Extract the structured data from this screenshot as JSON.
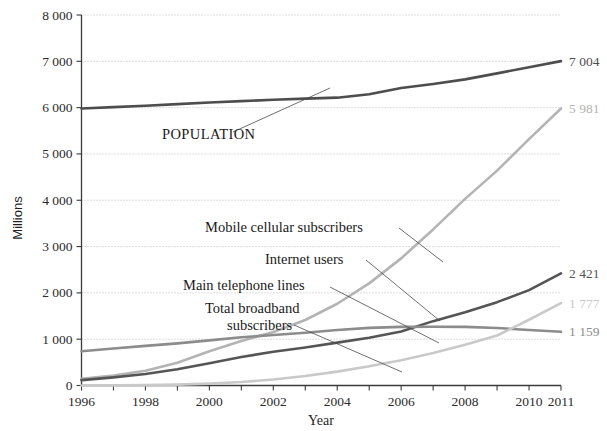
{
  "chart_data": {
    "type": "line",
    "title": "",
    "xlabel": "Year",
    "ylabel": "Millions",
    "xlim": [
      1996,
      2011
    ],
    "ylim": [
      0,
      8000
    ],
    "grid": true,
    "legend_position": "inline-annotations",
    "x": [
      1996,
      1997,
      1998,
      1999,
      2000,
      2001,
      2002,
      2003,
      2004,
      2005,
      2006,
      2007,
      2008,
      2009,
      2010,
      2011
    ],
    "ytick_labels": [
      "0",
      "1 000",
      "2 000",
      "3 000",
      "4 000",
      "5 000",
      "6 000",
      "7 000",
      "8 000"
    ],
    "ytick_values": [
      0,
      1000,
      2000,
      3000,
      4000,
      5000,
      6000,
      7000,
      8000
    ],
    "xtick_labels": [
      "1996",
      "1998",
      "2000",
      "2002",
      "2004",
      "2006",
      "2008",
      "2010",
      "2011"
    ],
    "xtick_values": [
      1996,
      1998,
      2000,
      2002,
      2004,
      2006,
      2008,
      2010,
      2011
    ],
    "series": [
      {
        "name": "POPULATION",
        "color": "#4d4d4d",
        "width": 2.6,
        "label_style": "uppercase",
        "end_value_label": "7 004",
        "end_value": 7004,
        "values": [
          5980,
          6010,
          6040,
          6075,
          6110,
          6140,
          6170,
          6195,
          6215,
          6290,
          6425,
          6510,
          6610,
          6740,
          6870,
          7004
        ]
      },
      {
        "name": "Mobile cellular subscribers",
        "color": "#b4b4b4",
        "width": 2.6,
        "end_value_label": "5 981",
        "end_value": 5981,
        "values": [
          145,
          215,
          318,
          490,
          740,
          960,
          1155,
          1415,
          1765,
          2205,
          2745,
          3370,
          4030,
          4640,
          5320,
          5981
        ]
      },
      {
        "name": "Internet users",
        "color": "#555555",
        "width": 2.6,
        "end_value_label": "2 421",
        "end_value": 2421,
        "values": [
          115,
          175,
          250,
          350,
          480,
          615,
          730,
          820,
          925,
          1030,
          1165,
          1390,
          1580,
          1800,
          2060,
          2421
        ]
      },
      {
        "name": "Main telephone lines",
        "color": "#8c8c8c",
        "width": 2.6,
        "end_value_label": "1 159",
        "end_value": 1159,
        "values": [
          741,
          800,
          855,
          910,
          975,
          1040,
          1090,
          1140,
          1200,
          1245,
          1265,
          1270,
          1265,
          1240,
          1200,
          1159
        ]
      },
      {
        "name": "Total broadband subscribers",
        "color": "#c9c9c9",
        "width": 2.6,
        "end_value_label": "1 777",
        "end_value": 1777,
        "values": [
          0,
          3,
          8,
          18,
          40,
          75,
          130,
          205,
          300,
          415,
          545,
          700,
          880,
          1080,
          1420,
          1777
        ]
      }
    ],
    "annotations": [
      {
        "text": "POPULATION",
        "x": 162,
        "y": 139
      },
      {
        "text": "Mobile cellular subscribers",
        "x": 205,
        "y": 232
      },
      {
        "text": "Internet users",
        "x": 265,
        "y": 264
      },
      {
        "text": "Main telephone lines",
        "x": 183,
        "y": 290
      },
      {
        "text": "Total broadband",
        "x": 205,
        "y": 313
      },
      {
        "text": "subscribers",
        "x": 227,
        "y": 330
      }
    ]
  }
}
